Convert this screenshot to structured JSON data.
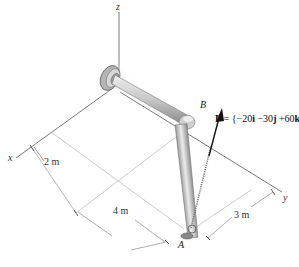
{
  "axes": {
    "x": "x",
    "y": "y",
    "z": "z"
  },
  "points": {
    "A": "A",
    "B": "B"
  },
  "dimensions": {
    "d1": "2 m",
    "d2": "4 m",
    "d3": "3 m"
  },
  "force": {
    "symbol": "F",
    "equals": " = {",
    "i_coef": "−20",
    "i_unit": "i",
    "j_coef": " −30",
    "j_unit": "j",
    "k_coef": " +60",
    "k_unit": "k",
    "close": "}N"
  },
  "colors": {
    "line": "#555555",
    "light_line": "#aaaaaa",
    "pipe_fill": "#c8c8c8",
    "pipe_edge": "#777777",
    "arrow": "#111111"
  }
}
